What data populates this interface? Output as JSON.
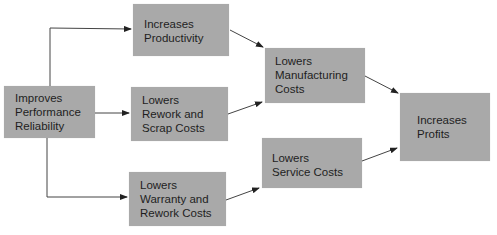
{
  "diagram": {
    "type": "flowchart",
    "colors": {
      "box_fill": "#a9a9a9",
      "text": "#1e1e1e",
      "arrow": "#333333",
      "background": "#ffffff"
    },
    "nodes": [
      {
        "id": "reliability",
        "label": "Improves\nPerformance\nReliability"
      },
      {
        "id": "productivity",
        "label": "Increases\nProductivity"
      },
      {
        "id": "rework_scrap",
        "label": "Lowers\nRework and\nScrap Costs"
      },
      {
        "id": "warranty",
        "label": "Lowers\nWarranty and\nRework Costs"
      },
      {
        "id": "manufacturing",
        "label": "Lowers\nManufacturing\nCosts"
      },
      {
        "id": "service",
        "label": "Lowers\nService Costs"
      },
      {
        "id": "profits",
        "label": "Increases\nProfits"
      }
    ],
    "edges": [
      {
        "from": "reliability",
        "to": "productivity"
      },
      {
        "from": "reliability",
        "to": "rework_scrap"
      },
      {
        "from": "reliability",
        "to": "warranty"
      },
      {
        "from": "productivity",
        "to": "manufacturing"
      },
      {
        "from": "rework_scrap",
        "to": "manufacturing"
      },
      {
        "from": "warranty",
        "to": "service"
      },
      {
        "from": "manufacturing",
        "to": "profits"
      },
      {
        "from": "service",
        "to": "profits"
      }
    ]
  }
}
